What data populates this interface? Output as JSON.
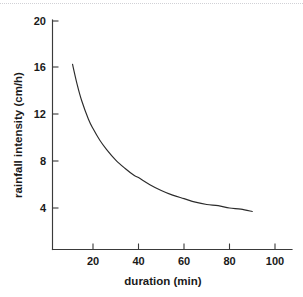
{
  "figure": {
    "background_color": "#ffffff",
    "ink_color": "#2b2b2b",
    "top_rule_color": "#c9c9cf"
  },
  "chart_data": {
    "type": "line",
    "title": "",
    "subtitle": "",
    "xlabel": "duration (min)",
    "ylabel": "rainfall intensity (cm/h)",
    "xlim": [
      0,
      108
    ],
    "ylim": [
      0,
      21
    ],
    "xticks": [
      20,
      40,
      60,
      80,
      100
    ],
    "xtick_labels": [
      "20",
      "40",
      "60",
      "80",
      "100"
    ],
    "yticks": [
      4,
      8,
      12,
      16,
      20
    ],
    "ytick_labels": [
      "4",
      "8",
      "12",
      "16",
      "20"
    ],
    "grid": false,
    "legend": false,
    "legend_position": "none",
    "annotations": [],
    "series": [
      {
        "name": "rainfall intensity",
        "color": "#2b2b2b",
        "line_width": 1.15,
        "marker": "none",
        "x": [
          11,
          13,
          15,
          18,
          20,
          23,
          26,
          30,
          34,
          38,
          40,
          45,
          50,
          55,
          60,
          65,
          70,
          75,
          80,
          85,
          90
        ],
        "y": [
          16.3,
          14.6,
          13.2,
          11.6,
          10.8,
          9.8,
          9.0,
          8.1,
          7.4,
          6.8,
          6.6,
          6.0,
          5.5,
          5.1,
          4.8,
          4.5,
          4.3,
          4.2,
          4.0,
          3.9,
          3.7
        ]
      }
    ]
  },
  "axis": {
    "x_tick_0_label": "20",
    "x_tick_1_label": "40",
    "x_tick_2_label": "60",
    "x_tick_3_label": "80",
    "x_tick_4_label": "100",
    "y_tick_0_label": "4",
    "y_tick_1_label": "8",
    "y_tick_2_label": "12",
    "y_tick_3_label": "16",
    "y_tick_4_label": "20",
    "x_title": "duration (min)",
    "y_title": "rainfall intensity (cm/h)"
  }
}
